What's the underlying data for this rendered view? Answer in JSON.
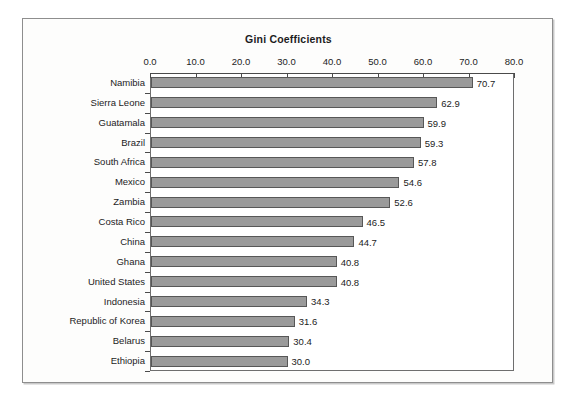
{
  "chart_data": {
    "type": "bar",
    "orientation": "horizontal",
    "title": "Gini Coefficients",
    "xlabel": "",
    "ylabel": "",
    "xlim": [
      0,
      80
    ],
    "xticks": [
      "0.0",
      "10.0",
      "20.0",
      "30.0",
      "40.0",
      "50.0",
      "60.0",
      "70.0",
      "80.0"
    ],
    "xtick_values": [
      0,
      10,
      20,
      30,
      40,
      50,
      60,
      70,
      80
    ],
    "grid": false,
    "legend": false,
    "bar_color": "#9a9a9a",
    "bar_border_color": "#575757",
    "categories": [
      "Namibia",
      "Sierra Leone",
      "Guatamala",
      "Brazil",
      "South Africa",
      "Mexico",
      "Zambia",
      "Costa Rico",
      "China",
      "Ghana",
      "United States",
      "Indonesia",
      "Republic of Korea",
      "Belarus",
      "Ethiopia"
    ],
    "values": [
      70.7,
      62.9,
      59.9,
      59.3,
      57.8,
      54.6,
      52.6,
      46.5,
      44.7,
      40.8,
      40.8,
      34.3,
      31.6,
      30.4,
      30.0
    ],
    "value_labels": [
      "70.7",
      "62.9",
      "59.9",
      "59.3",
      "57.8",
      "54.6",
      "52.6",
      "46.5",
      "44.7",
      "40.8",
      "40.8",
      "34.3",
      "31.6",
      "30.4",
      "30.0"
    ]
  }
}
